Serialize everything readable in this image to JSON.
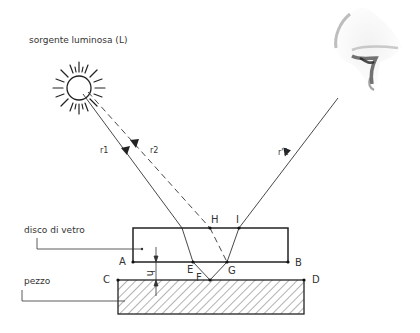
{
  "diagram": {
    "type": "optics-interference-diagram",
    "labels": {
      "light_source": "sorgente luminosa (L)",
      "glass_disc": "disco di vetro",
      "workpiece": "pezzo",
      "gap": "h"
    },
    "rays": {
      "r1": "r1",
      "r2": "r2",
      "r1_reflected": "r'1"
    },
    "points": {
      "A": "A",
      "B": "B",
      "C": "C",
      "D": "D",
      "E": "E",
      "F": "F",
      "G": "G",
      "H": "H",
      "I": "I"
    },
    "icons": {
      "source": "sun-icon",
      "observer": "eye-icon"
    },
    "colors": {
      "line": "#333333",
      "hatch": "#555555",
      "background": "#ffffff"
    }
  }
}
